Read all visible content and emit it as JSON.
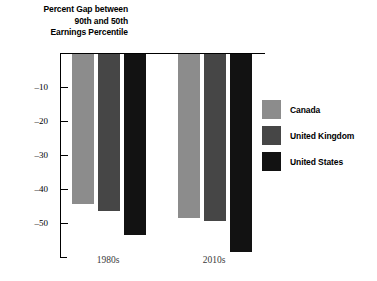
{
  "chart_data": {
    "type": "bar",
    "title": "Percent Gap between 90th and 50th Earnings Percentile",
    "title_lines": [
      "Percent Gap between",
      "90th and 50th",
      "Earnings Percentile"
    ],
    "xlabel": "",
    "ylabel": "",
    "categories": [
      "1980s",
      "2010s"
    ],
    "series": [
      {
        "name": "Canada",
        "values": [
          -44,
          -48
        ],
        "color": "#8c8c8c"
      },
      {
        "name": "United Kingdom",
        "values": [
          -46,
          -49
        ],
        "color": "#464646"
      },
      {
        "name": "United States",
        "values": [
          -53,
          -58
        ],
        "color": "#121212"
      }
    ],
    "ylim": [
      -60,
      0
    ],
    "yticks": [
      -10,
      -20,
      -30,
      -40,
      -50
    ],
    "ytick_labels": [
      "–10",
      "–20",
      "–30",
      "–40",
      "–50"
    ],
    "grid": false,
    "legend_position": "right",
    "orientation": "vertical-downward",
    "baseline_value": 0
  },
  "legend": {
    "entries": [
      {
        "label": "Canada",
        "color": "#8c8c8c"
      },
      {
        "label": "United Kingdom",
        "color": "#464646"
      },
      {
        "label": "United States",
        "color": "#121212"
      }
    ]
  },
  "axis": {
    "y_tick_labels": [
      "–10",
      "–20",
      "–30",
      "–40",
      "–50"
    ],
    "x_group_labels": [
      "1980s",
      "2010s"
    ]
  }
}
